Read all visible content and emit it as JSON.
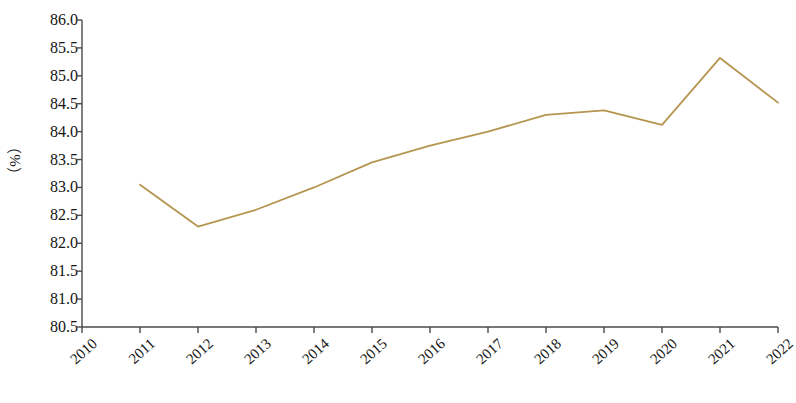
{
  "chart_data": {
    "type": "line",
    "title": "",
    "xlabel": "",
    "ylabel": "（%）",
    "categories": [
      "2010",
      "2011",
      "2012",
      "2013",
      "2014",
      "2015",
      "2016",
      "2017",
      "2018",
      "2019",
      "2020",
      "2021",
      "2022"
    ],
    "x": [
      2010,
      2011,
      2012,
      2013,
      2014,
      2015,
      2016,
      2017,
      2018,
      2019,
      2020,
      2021,
      2022
    ],
    "values": [
      null,
      83.05,
      82.3,
      82.6,
      83.0,
      83.45,
      83.75,
      84.0,
      84.3,
      84.38,
      84.12,
      85.32,
      84.52
    ],
    "ylim": [
      80.5,
      86.0
    ],
    "ytick_labels": [
      "86.0",
      "85.5",
      "85.0",
      "84.5",
      "84.0",
      "83.5",
      "83.0",
      "82.5",
      "82.0",
      "81.5",
      "81.0",
      "80.5"
    ],
    "ytick_values": [
      86.0,
      85.5,
      85.0,
      84.5,
      84.0,
      83.5,
      83.0,
      82.5,
      82.0,
      81.5,
      81.0,
      80.5
    ],
    "ytick_step": 0.5,
    "grid": false,
    "legend": null,
    "series": [
      {
        "name": "",
        "color": "#b5954f",
        "points": [
          {
            "x": "2011",
            "y": 83.05
          },
          {
            "x": "2012",
            "y": 82.3
          },
          {
            "x": "2013",
            "y": 82.6
          },
          {
            "x": "2014",
            "y": 83.0
          },
          {
            "x": "2015",
            "y": 83.45
          },
          {
            "x": "2016",
            "y": 83.75
          },
          {
            "x": "2017",
            "y": 84.0
          },
          {
            "x": "2018",
            "y": 84.3
          },
          {
            "x": "2019",
            "y": 84.38
          },
          {
            "x": "2020",
            "y": 84.12
          },
          {
            "x": "2021",
            "y": 85.32
          },
          {
            "x": "2022",
            "y": 84.52
          }
        ]
      }
    ]
  },
  "colors": {
    "line": "#b5954f",
    "axis": "#4a4a4a",
    "text": "#141414",
    "background": "#ffffff"
  },
  "caption": ""
}
